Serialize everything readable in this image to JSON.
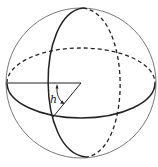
{
  "figure": {
    "angle_label": "h",
    "colors": {
      "stroke": "#222222",
      "outline": "#555555",
      "background": "#ffffff"
    }
  }
}
